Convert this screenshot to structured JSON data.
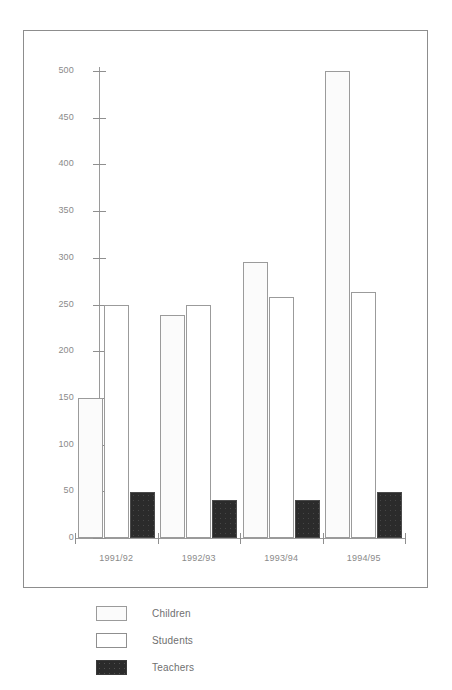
{
  "chart_data": {
    "type": "bar",
    "title": "",
    "xlabel": "",
    "ylabel": "",
    "grid": false,
    "legend_position": "bottom-left",
    "categories": [
      "1991/92",
      "1992/93",
      "1993/94",
      "1994/95"
    ],
    "ylim": [
      0,
      500
    ],
    "yticks": [
      0,
      50,
      100,
      150,
      200,
      250,
      300,
      350,
      400,
      450,
      500
    ],
    "ytick_labels": [
      "0",
      "50",
      "100",
      "150",
      "200",
      "250",
      "300",
      "350",
      "400",
      "450",
      "500"
    ],
    "series": [
      {
        "name": "Children",
        "fill": "dotted-light",
        "color": "#fbfbfb",
        "values": [
          150,
          239,
          295,
          500
        ]
      },
      {
        "name": "Students",
        "fill": "solid-white",
        "color": "#ffffff",
        "values": [
          250,
          250,
          258,
          263
        ]
      },
      {
        "name": "Teachers",
        "fill": "solid-black",
        "color": "#2b2b2b",
        "values": [
          49,
          41,
          41,
          49
        ]
      }
    ]
  },
  "legend": {
    "items": [
      {
        "label": "Children",
        "style": "children"
      },
      {
        "label": "Students",
        "style": "students"
      },
      {
        "label": "Teachers",
        "style": "teachers"
      }
    ]
  },
  "axes": {
    "y_axis_name": "value-axis",
    "x_axis_name": "category-axis"
  }
}
